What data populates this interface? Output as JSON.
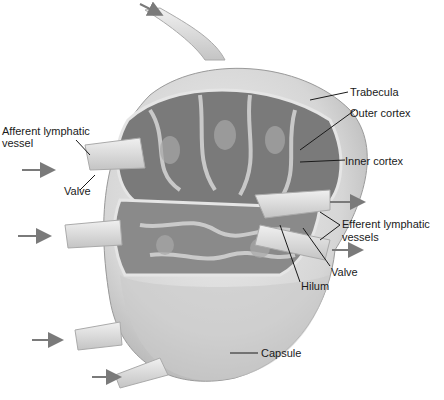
{
  "diagram": {
    "labels": {
      "trabecula": "Trabecula",
      "outer_cortex": "Outer cortex",
      "inner_cortex": "Inner cortex",
      "afferent_line1": "Afferent lymphatic",
      "afferent_line2": "vessel",
      "valve_left": "Valve",
      "efferent_line1": "Efferent lymphatic",
      "efferent_line2": "vessels",
      "valve_right": "Valve",
      "hilum": "Hilum",
      "capsule": "Capsule"
    },
    "colors": {
      "capsule_fill": "#d8d8d8",
      "cortex_dark": "#6e6e6e",
      "medulla_light": "#bdbdbd",
      "arrow": "#7a7a7a",
      "leader_line": "#1a1a1a"
    }
  }
}
